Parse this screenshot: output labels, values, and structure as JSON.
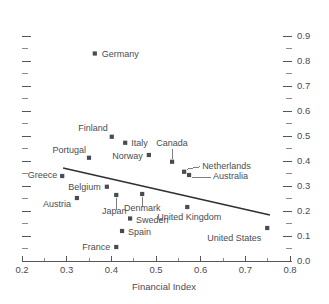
{
  "chart_data": {
    "type": "scatter",
    "title": "",
    "xlabel": "Financial Index",
    "ylabel": "",
    "xlim": [
      0.2,
      0.8
    ],
    "ylim": [
      0.0,
      0.95
    ],
    "grid": false,
    "legend": "none",
    "x_ticks": [
      "0.2",
      "0.3",
      "0.4",
      "0.5",
      "0.6",
      "0.7",
      "0.8"
    ],
    "x_tick_values": [
      0.2,
      0.3,
      0.4,
      0.5,
      0.6,
      0.7,
      0.8
    ],
    "x_minor_tick_values": [
      0.25,
      0.35,
      0.45,
      0.55,
      0.65,
      0.75
    ],
    "y_ticks": [
      "0.0",
      "0.1",
      "0.2",
      "0.3",
      "0.4",
      "0.5",
      "0.6",
      "0.7",
      "0.8",
      "0.9"
    ],
    "y_tick_values": [
      0.0,
      0.1,
      0.2,
      0.3,
      0.4,
      0.5,
      0.6,
      0.7,
      0.8,
      0.9
    ],
    "y_minor_tick_values": [
      0.05,
      0.15,
      0.25,
      0.35,
      0.45,
      0.55,
      0.65,
      0.75,
      0.85
    ],
    "y_axis_side": "right",
    "y_mirror_ticks_left": true,
    "marker_shape": "square",
    "marker_color": "#4a4b50",
    "points": [
      {
        "label": "Germany",
        "x": 0.363,
        "y": 0.83,
        "label_pos": "right"
      },
      {
        "label": "Finland",
        "x": 0.401,
        "y": 0.497,
        "label_pos": "above-left"
      },
      {
        "label": "Italy",
        "x": 0.431,
        "y": 0.473,
        "label_pos": "right"
      },
      {
        "label": "Norway",
        "x": 0.484,
        "y": 0.424,
        "label_pos": "left"
      },
      {
        "label": "Portugal",
        "x": 0.35,
        "y": 0.413,
        "label_pos": "above-left"
      },
      {
        "label": "Canada",
        "x": 0.536,
        "y": 0.397,
        "label_pos": "leader-above"
      },
      {
        "label": "Netherlands",
        "x": 0.563,
        "y": 0.357,
        "label_pos": "leader-right"
      },
      {
        "label": "Australia",
        "x": 0.574,
        "y": 0.344,
        "label_pos": "leader-right"
      },
      {
        "label": "Greece",
        "x": 0.29,
        "y": 0.34,
        "label_pos": "left"
      },
      {
        "label": "Belgium",
        "x": 0.39,
        "y": 0.297,
        "label_pos": "left"
      },
      {
        "label": "Denmark",
        "x": 0.469,
        "y": 0.268,
        "label_pos": "leader-below"
      },
      {
        "label": "Japan",
        "x": 0.411,
        "y": 0.264,
        "label_pos": "leader-below"
      },
      {
        "label": "Austria",
        "x": 0.323,
        "y": 0.252,
        "label_pos": "below-left"
      },
      {
        "label": "United Kingdom",
        "x": 0.57,
        "y": 0.216,
        "label_pos": "below"
      },
      {
        "label": "Sweden",
        "x": 0.442,
        "y": 0.17,
        "label_pos": "right"
      },
      {
        "label": "United States",
        "x": 0.749,
        "y": 0.132,
        "label_pos": "below-left"
      },
      {
        "label": "Spain",
        "x": 0.424,
        "y": 0.12,
        "label_pos": "right"
      },
      {
        "label": "France",
        "x": 0.411,
        "y": 0.056,
        "label_pos": "left"
      }
    ],
    "trend_line": {
      "x0": 0.292,
      "y0": 0.372,
      "x1": 0.755,
      "y1": 0.184
    }
  }
}
